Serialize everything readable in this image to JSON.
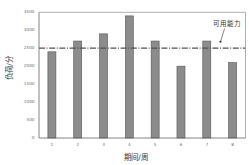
{
  "chart_data": {
    "type": "bar",
    "title": "",
    "xlabel": "期间/周",
    "ylabel": "负荷/分",
    "categories": [
      "1",
      "2",
      "3",
      "4",
      "5",
      "6",
      "7",
      "8"
    ],
    "values": [
      2400,
      2700,
      2900,
      3400,
      2700,
      2000,
      2700,
      2100
    ],
    "series": [
      {
        "name": "负荷",
        "values": [
          2400,
          2700,
          2900,
          3400,
          2700,
          2000,
          2700,
          2100
        ]
      }
    ],
    "ylim": [
      0,
      3500
    ],
    "yticks": [
      0,
      500,
      1000,
      1500,
      2000,
      2500,
      3000,
      3500
    ],
    "grid": false,
    "legend": null,
    "reference_lines": [
      {
        "y": 2500,
        "style": "dash-dot",
        "label": "可用能力"
      }
    ],
    "annotations": [
      {
        "text": "可用能力",
        "x": 7.78,
        "y": 3170,
        "arrow_from": {
          "x": 7.69,
          "y": 3050
        },
        "arrow_to": {
          "x": 7.53,
          "y": 2680
        }
      }
    ]
  },
  "colors": {
    "bar_fill": "#8c8c8c",
    "bar_stroke": "#555555",
    "reference_line": "#505050",
    "frame": "#9a9a9a",
    "axis": "#666666",
    "text": "#333333"
  }
}
